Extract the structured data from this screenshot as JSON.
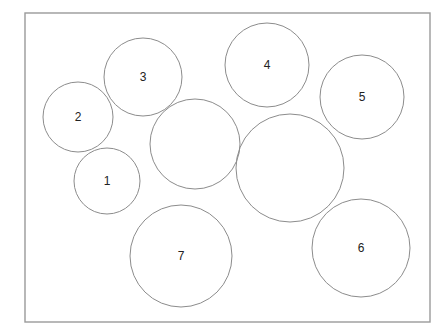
{
  "diagram": {
    "frame": {
      "x": 25,
      "y": 13,
      "width": 405,
      "height": 309
    },
    "colors": {
      "frame_stroke": "#9a9a9a",
      "circle_stroke": "#8c8c8c",
      "label_text": "#222222",
      "background": "#ffffff"
    },
    "circles": [
      {
        "id": "circle-1",
        "label": "1",
        "cx": 107,
        "cy": 181,
        "r": 33
      },
      {
        "id": "circle-2",
        "label": "2",
        "cx": 78,
        "cy": 117,
        "r": 35
      },
      {
        "id": "circle-3",
        "label": "3",
        "cx": 143,
        "cy": 77,
        "r": 39
      },
      {
        "id": "circle-4",
        "label": "4",
        "cx": 267,
        "cy": 65,
        "r": 42
      },
      {
        "id": "circle-5",
        "label": "5",
        "cx": 362,
        "cy": 97,
        "r": 42
      },
      {
        "id": "circle-6",
        "label": "6",
        "cx": 361,
        "cy": 248,
        "r": 49
      },
      {
        "id": "circle-7",
        "label": "7",
        "cx": 181,
        "cy": 256,
        "r": 51
      },
      {
        "id": "circle-unlabeled-a",
        "label": "",
        "cx": 195,
        "cy": 144,
        "r": 45
      },
      {
        "id": "circle-unlabeled-b",
        "label": "",
        "cx": 290,
        "cy": 168,
        "r": 54
      }
    ]
  }
}
